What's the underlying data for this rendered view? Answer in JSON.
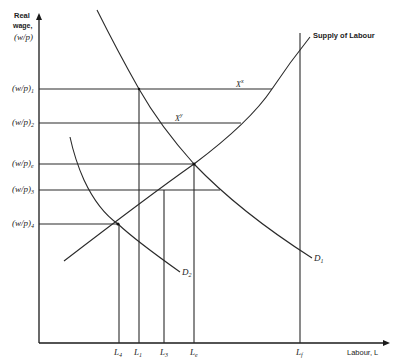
{
  "diagram": {
    "y_axis_label": [
      "Real",
      "wage,",
      "(w/p)"
    ],
    "x_axis_label": "Labour, L",
    "curves": {
      "supply": "Supply of Labour",
      "demand_1": "D",
      "demand_1_sub": "1",
      "demand_2": "D",
      "demand_2_sub": "2"
    },
    "wage_levels": [
      {
        "label": "(w/p)",
        "sub": "1"
      },
      {
        "label": "(w/p)",
        "sub": "2"
      },
      {
        "label": "(w/p)",
        "sub": "e"
      },
      {
        "label": "(w/p)",
        "sub": "3"
      },
      {
        "label": "(w/p)",
        "sub": "4"
      }
    ],
    "labour_levels": [
      {
        "label": "L",
        "sub": "4"
      },
      {
        "label": "L",
        "sub": "1"
      },
      {
        "label": "L",
        "sub": "3"
      },
      {
        "label": "L",
        "sub": "e"
      },
      {
        "label": "L",
        "sub": "f"
      }
    ],
    "gaps": [
      {
        "label": "X",
        "sup": "x"
      },
      {
        "label": "X",
        "sup": "y"
      }
    ]
  }
}
